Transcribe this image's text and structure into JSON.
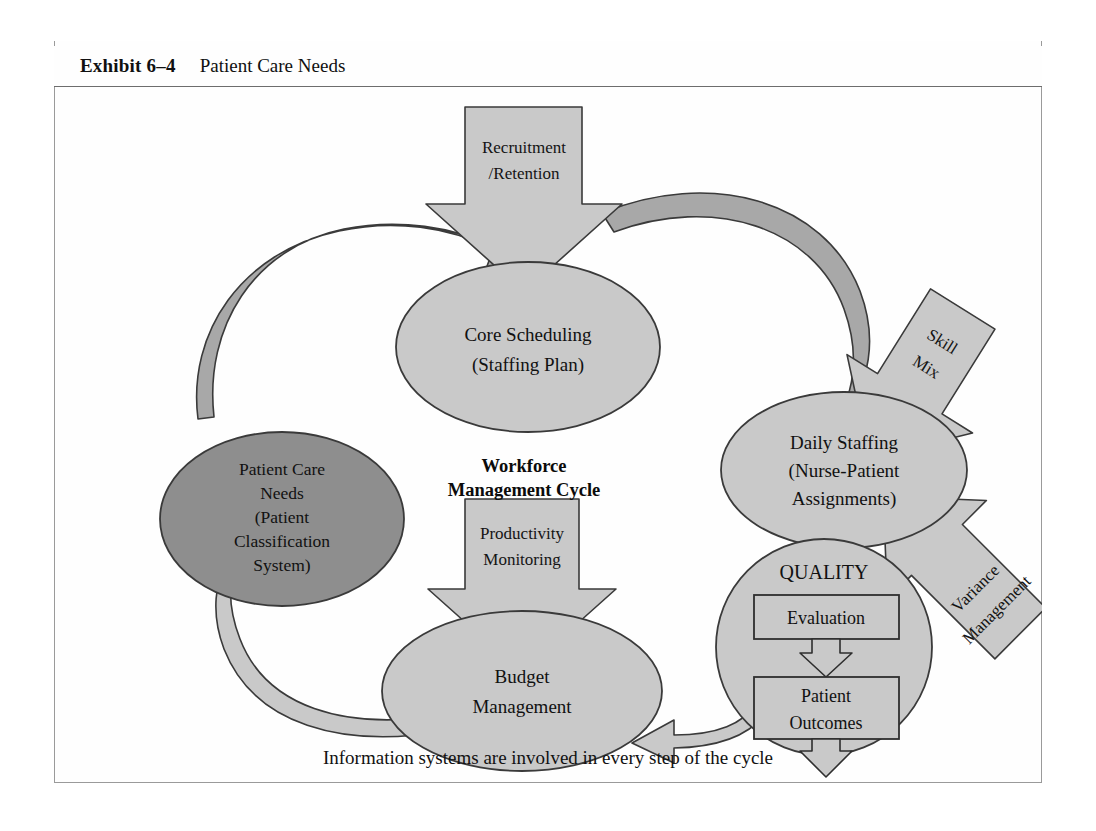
{
  "exhibit": {
    "label": "Exhibit 6–4",
    "title": "Patient Care Needs"
  },
  "diagram": {
    "center_title_line1": "Workforce",
    "center_title_line2": "Management Cycle",
    "caption": "Information systems are involved in every step of the cycle",
    "nodes": [
      {
        "id": "patient-care-needs",
        "shape": "ellipse",
        "fill": "#8e8e8e",
        "lines": [
          "Patient Care",
          "Needs",
          "(Patient",
          "Classification",
          "System)"
        ]
      },
      {
        "id": "core-scheduling",
        "shape": "ellipse",
        "fill": "#c9c9c9",
        "lines": [
          "Core Scheduling",
          "(Staffing Plan)"
        ]
      },
      {
        "id": "daily-staffing",
        "shape": "ellipse",
        "fill": "#c9c9c9",
        "lines": [
          "Daily Staffing",
          "(Nurse-Patient",
          "Assignments)"
        ]
      },
      {
        "id": "quality",
        "shape": "circle",
        "fill": "#c9c9c9",
        "lines": [
          "QUALITY"
        ]
      },
      {
        "id": "budget-management",
        "shape": "ellipse",
        "fill": "#c9c9c9",
        "lines": [
          "Budget",
          "Management"
        ]
      }
    ],
    "quality_boxes": [
      {
        "id": "evaluation",
        "label": "Evaluation",
        "fill": "#c9c9c9"
      },
      {
        "id": "patient-outcomes",
        "line1": "Patient",
        "line2": "Outcomes",
        "fill": "#c9c9c9"
      }
    ],
    "input_arrows": [
      {
        "id": "recruitment-retention",
        "line1": "Recruitment",
        "line2": "/Retention",
        "direction": "down",
        "target": "core-scheduling"
      },
      {
        "id": "skill-mix",
        "line1": "Skill",
        "line2": "Mix",
        "direction": "down-left",
        "target": "daily-staffing"
      },
      {
        "id": "variance-management",
        "line1": "Variance",
        "line2": "Management",
        "direction": "up-left",
        "target": "daily-staffing"
      },
      {
        "id": "productivity-monitoring",
        "line1": "Productivity",
        "line2": "Monitoring",
        "direction": "down",
        "target": "budget-management"
      }
    ],
    "cycle_flow": [
      "patient-care-needs",
      "core-scheduling",
      "daily-staffing",
      "quality",
      "budget-management"
    ]
  },
  "colors": {
    "node_light": "#c9c9c9",
    "node_dark": "#8e8e8e",
    "arrow_fill": "#c9c9c9",
    "arrow_fill_dark": "#a8a8a8",
    "stroke": "#3a3a3a",
    "frame_border": "#9a9a9a",
    "header_rule": "#6d6d6d"
  }
}
